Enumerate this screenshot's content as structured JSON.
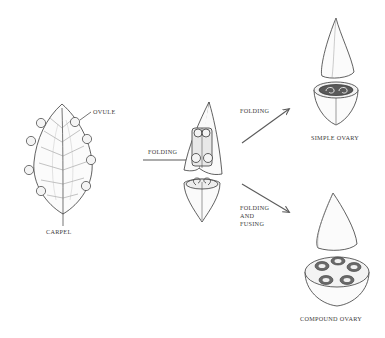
{
  "diagram": {
    "labels": {
      "ovule": "OVULE",
      "carpel": "CARPEL",
      "folding_main": "FOLDING",
      "folding_upper": "FOLDING",
      "folding_fusing_lines": [
        "FOLDING",
        "AND",
        "FUSING"
      ],
      "simple_ovary": "SIMPLE OVARY",
      "compound_ovary": "COMPOUND OVARY"
    },
    "colors": {
      "ink": "#3a3a3a",
      "arrow": "#5a5a5a",
      "background": "#ffffff"
    },
    "stages": [
      {
        "id": "carpel",
        "label": "CARPEL",
        "ovule_count": 8
      },
      {
        "id": "folded-carpel",
        "via": "FOLDING"
      },
      {
        "id": "simple-ovary",
        "label": "SIMPLE OVARY",
        "via": "FOLDING"
      },
      {
        "id": "compound-ovary",
        "label": "COMPOUND OVARY",
        "via": "FOLDING AND FUSING",
        "locules": 5
      }
    ]
  }
}
